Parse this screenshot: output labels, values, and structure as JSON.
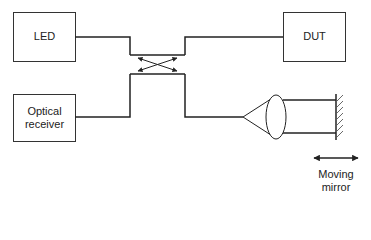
{
  "diagram": {
    "type": "fiber-optic michelson interferometer (OLCR / reflectometry setup)",
    "nodes": [
      {
        "id": "led",
        "label": "LED"
      },
      {
        "id": "dut",
        "label": "DUT"
      },
      {
        "id": "receiver",
        "label": "Optical\nreceiver",
        "lines": [
          "Optical",
          "receiver"
        ]
      },
      {
        "id": "coupler",
        "label": ""
      },
      {
        "id": "lens",
        "label": ""
      },
      {
        "id": "mirror",
        "label": "Moving\nmirror",
        "lines": [
          "Moving",
          "mirror"
        ]
      }
    ],
    "edges": [
      {
        "from": "led",
        "to": "coupler"
      },
      {
        "from": "coupler",
        "to": "dut"
      },
      {
        "from": "receiver",
        "to": "coupler"
      },
      {
        "from": "coupler",
        "to": "lens"
      },
      {
        "from": "lens",
        "to": "mirror"
      }
    ],
    "colors": {
      "stroke": "#222222",
      "background": "#ffffff"
    }
  }
}
